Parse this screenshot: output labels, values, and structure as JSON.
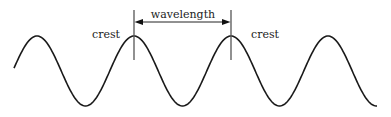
{
  "diagram": {
    "labels": {
      "crest_left": "crest",
      "crest_right": "crest",
      "wavelength": "wavelength"
    },
    "colors": {
      "wave": "#1a1a1a",
      "marker": "#555555",
      "text": "#222222"
    },
    "wave": {
      "start_x": 14,
      "end_x": 377,
      "center_y": 71,
      "amplitude": 35,
      "period_px": 97,
      "crest_x": [
        37,
        134,
        231,
        328
      ]
    },
    "markers": {
      "left_x": 134,
      "right_x": 231,
      "top_y": 10,
      "bottom_y": 60,
      "arrow_y": 22
    }
  }
}
